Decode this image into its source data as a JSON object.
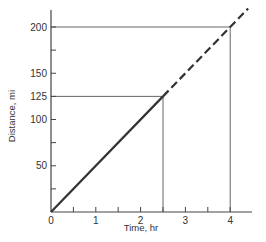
{
  "chart_data": {
    "type": "line",
    "title": "",
    "xlabel": "Time, hr",
    "ylabel": "Distance, mi",
    "xlim": [
      0,
      4.5
    ],
    "ylim": [
      0,
      225
    ],
    "x_ticks": [
      0,
      0.5,
      1,
      1.5,
      2,
      2.5,
      3,
      3.5,
      4
    ],
    "x_tick_labels": [
      "0",
      "1",
      "2",
      "3",
      "4"
    ],
    "x_tick_label_values": [
      0,
      1,
      2,
      3,
      4
    ],
    "y_ticks": [
      25,
      50,
      75,
      100,
      125,
      150,
      175,
      200
    ],
    "y_tick_labels": [
      "50",
      "100",
      "125",
      "150",
      "200"
    ],
    "y_tick_label_values": [
      50,
      100,
      125,
      150,
      200
    ],
    "grid": false,
    "legend": null,
    "series": [
      {
        "name": "distance (solid)",
        "style": "solid",
        "x": [
          0,
          2.5
        ],
        "y": [
          0,
          125
        ]
      },
      {
        "name": "distance (extrapolated, dashed)",
        "style": "dashed",
        "x": [
          2.5,
          4,
          4.4
        ],
        "y": [
          125,
          200,
          220
        ]
      }
    ],
    "reference_lines": [
      {
        "type": "horizontal",
        "y": 125,
        "x_from": 0,
        "x_to": 2.5
      },
      {
        "type": "vertical",
        "x": 2.5,
        "y_from": 0,
        "y_to": 125
      },
      {
        "type": "horizontal",
        "y": 200,
        "x_from": 0,
        "x_to": 4
      },
      {
        "type": "vertical",
        "x": 4,
        "y_from": 0,
        "y_to": 200
      }
    ],
    "annotations": []
  },
  "colors": {
    "line": "#333333",
    "axis": "#444444",
    "reference": "#555555"
  }
}
